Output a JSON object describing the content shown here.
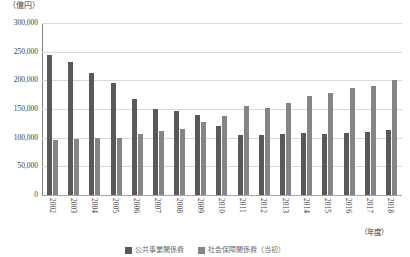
{
  "chart_data": {
    "type": "bar",
    "title": "",
    "unit_label": "（億円）",
    "xlabel": "（年度）",
    "ylabel": "",
    "ylim": [
      0,
      300000
    ],
    "ytick_step": 50000,
    "ytick_labels": [
      "300,000",
      "250,000",
      "200,000",
      "150,000",
      "100,000",
      "50,000",
      "0"
    ],
    "ytick_values": [
      300000,
      250000,
      200000,
      150000,
      100000,
      50000,
      0
    ],
    "grid": true,
    "legend_position": "bottom",
    "categories": [
      "2002",
      "2003",
      "2004",
      "2005",
      "2006",
      "2007",
      "2008",
      "2009",
      "2010",
      "2011",
      "2012",
      "2013",
      "2014",
      "2015",
      "2016",
      "2017",
      "2018"
    ],
    "series": [
      {
        "name": "公共事業関係費",
        "color": "#595959",
        "values": [
          245000,
          232000,
          213000,
          196000,
          168000,
          150000,
          146000,
          139000,
          121000,
          105000,
          104000,
          107000,
          108000,
          106000,
          108000,
          110000,
          114000
        ]
      },
      {
        "name": "社会保障関係費（当初）",
        "color": "#858585",
        "values": [
          96000,
          97000,
          100000,
          100000,
          106000,
          111000,
          116000,
          127000,
          138000,
          155000,
          151000,
          160000,
          172000,
          178000,
          186000,
          190000,
          200000
        ]
      }
    ]
  }
}
